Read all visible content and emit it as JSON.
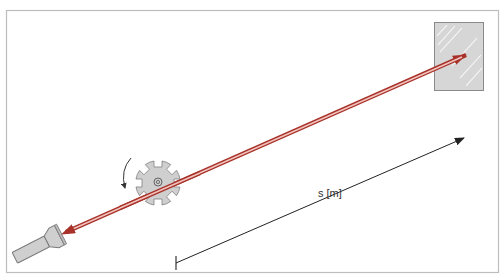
{
  "diagram": {
    "type": "physics-setup",
    "distance_label": "s [m]",
    "components": [
      {
        "id": "flashlight",
        "name": "light source (flashlight)"
      },
      {
        "id": "cogwheel",
        "name": "rotating toothed wheel",
        "teeth": 8,
        "rotation": "counter-clockwise"
      },
      {
        "id": "mirror",
        "name": "mirror"
      },
      {
        "id": "beam-out",
        "name": "outgoing light beam"
      },
      {
        "id": "beam-back",
        "name": "reflected light beam"
      },
      {
        "id": "distance-arrow",
        "name": "distance s between wheel and mirror"
      }
    ],
    "colors": {
      "frame": "#bdbdbd",
      "beam_outer": "#a8322a",
      "beam_inner": "#f2c4be",
      "object_fill": "#cfcfcf",
      "object_stroke": "#8a8a8a",
      "mirror_fill": "#d6d6d6",
      "arrow": "#222222"
    }
  }
}
